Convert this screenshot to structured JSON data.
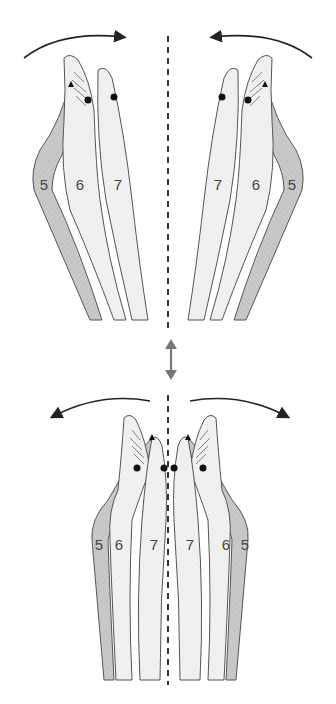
{
  "diagram": {
    "top_panel": {
      "left_group_labels": [
        "5",
        "6",
        "7"
      ],
      "right_group_labels": [
        "7",
        "6",
        "5"
      ],
      "arrows": [
        "rotate-inward-left",
        "rotate-inward-right"
      ]
    },
    "separator": {
      "icon": "double-arrow-vertical"
    },
    "bottom_panel": {
      "labels": [
        "5",
        "6",
        "7",
        "7",
        "6",
        "5"
      ],
      "arrows": [
        "rotate-outward-left",
        "rotate-outward-right"
      ]
    },
    "colors": {
      "outline": "#555555",
      "light_fill": "#efefef",
      "dark_fill": "#c8c8c8",
      "arrow": "#222222",
      "double_arrow": "#777777",
      "dot": "#111111"
    }
  }
}
